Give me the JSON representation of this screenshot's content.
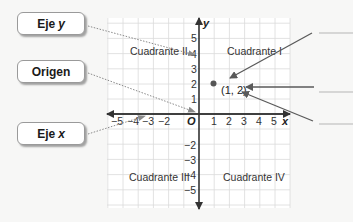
{
  "callouts": [
    {
      "id": "eje-y",
      "text": "Eje",
      "var": "y",
      "top": 12
    },
    {
      "id": "origen",
      "text": "Origen",
      "var": "",
      "top": 60
    },
    {
      "id": "eje-x",
      "text": "Eje",
      "var": "x",
      "top": 122
    }
  ],
  "plane": {
    "x_axis_label": "x",
    "y_axis_label": "y",
    "origin_label": "O",
    "x_ticks_positive": [
      "1",
      "2",
      "3",
      "4",
      "5"
    ],
    "x_ticks_negative": [
      "−5",
      "−4",
      "−3",
      "−2"
    ],
    "y_ticks_positive": [
      "1",
      "2",
      "3",
      "4",
      "5"
    ],
    "y_ticks_negative": [
      "−2",
      "−3",
      "−4",
      "−5"
    ],
    "quadrants": {
      "I": "Cuadrante I",
      "II": "Cuadrante II",
      "III": "Cuadrante III",
      "IV": "Cuadrante IV"
    },
    "point": {
      "label": "(1, 2)",
      "x": 1,
      "y": 2
    }
  },
  "answer_blanks": 3,
  "colors": {
    "grid": "#d9d9d9",
    "axis": "#333333",
    "arrow": "#5a5a5a",
    "dotted": "#7a7a7a",
    "blank_line": "#b5b5b5"
  }
}
